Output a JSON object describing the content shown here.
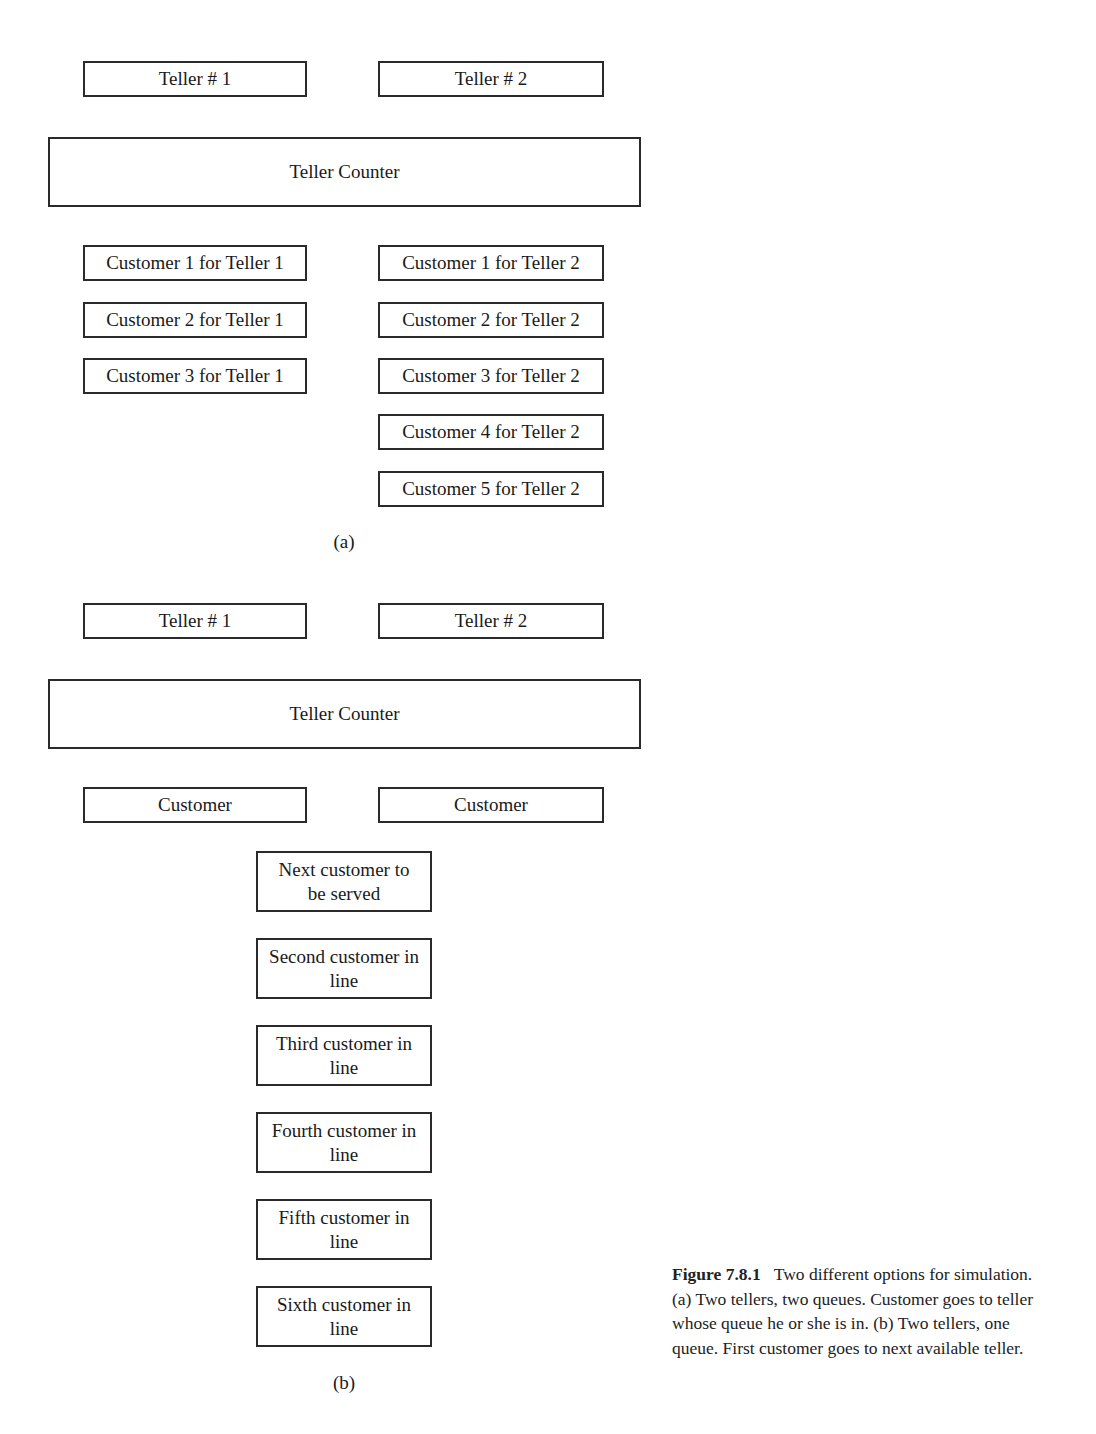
{
  "diagram_a": {
    "teller1": "Teller # 1",
    "teller2": "Teller # 2",
    "counter": "Teller Counter",
    "queue1": [
      "Customer 1 for Teller 1",
      "Customer 2 for Teller 1",
      "Customer 3 for Teller 1"
    ],
    "queue2": [
      "Customer 1 for Teller 2",
      "Customer 2 for Teller 2",
      "Customer 3 for Teller 2",
      "Customer 4 for Teller 2",
      "Customer 5 for Teller 2"
    ],
    "label": "(a)"
  },
  "diagram_b": {
    "teller1": "Teller # 1",
    "teller2": "Teller # 2",
    "counter": "Teller Counter",
    "served1": "Customer",
    "served2": "Customer",
    "queue": [
      "Next customer to be served",
      "Second customer in line",
      "Third customer in line",
      "Fourth customer in line",
      "Fifth customer in line",
      "Sixth customer in line"
    ],
    "label": "(b)"
  },
  "caption": {
    "number": "Figure 7.8.1",
    "text": "Two different options for simulation. (a) Two tellers, two queues. Customer goes to teller whose queue he or she is in. (b) Two tellers, one queue. First customer goes to next available teller."
  }
}
